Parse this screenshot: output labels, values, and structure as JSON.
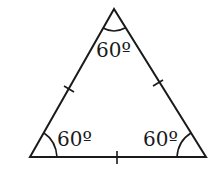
{
  "diagram": {
    "type": "equilateral-triangle",
    "vertices": {
      "apex": [
        114,
        9
      ],
      "bottom_left": [
        30,
        157
      ],
      "bottom_right": [
        206,
        157
      ]
    },
    "angles": {
      "top": "60º",
      "bottom_left": "60º",
      "bottom_right": "60º"
    },
    "tick_marks": [
      "left-side",
      "right-side",
      "base"
    ],
    "stroke_color": "#1a1a1a"
  }
}
